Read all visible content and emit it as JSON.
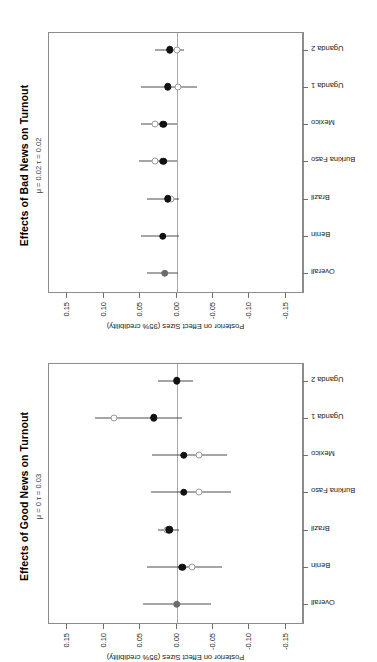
{
  "figure": {
    "orientation": "rotated-90-ccw",
    "panel_count": 2
  },
  "axis": {
    "value_axis_label": "Posterior on Effect Sizes (95% credibility)",
    "value_ticks": [
      "-0.15",
      "-0.10",
      "-0.05",
      "0.00",
      "0.05",
      "0.10",
      "0.15"
    ],
    "value_tick_values": [
      -0.15,
      -0.1,
      -0.05,
      0.0,
      0.05,
      0.1,
      0.15
    ],
    "categories": [
      "Overall",
      "Benin",
      "Brazil",
      "Burkina Faso",
      "Mexico",
      "Uganda 1",
      "Uganda 2"
    ]
  },
  "panels": {
    "bad": {
      "title": "Effects of Bad News on Turnout",
      "subtitle": "μ = 0.02  τ = 0.02"
    },
    "good": {
      "title": "Effects of Good News on Turnout",
      "subtitle": "μ = 0  τ = 0.03"
    }
  },
  "colors": {
    "filled_point": "#111111",
    "open_point": "#9a9a9a",
    "ci_line": "#4d4d4d",
    "zero_line": "#a8a8a8",
    "box_border": "#8c8c8c",
    "background": "#ffffff"
  },
  "chart_data": [
    {
      "type": "scatter",
      "id": "bad-news",
      "title": "Effects of Bad News on Turnout",
      "subtitle": "μ = 0.02  τ = 0.02",
      "xlabel": "",
      "ylabel": "Posterior on Effect Sizes (95% credibility)",
      "ylim": [
        -0.175,
        0.175
      ],
      "grid": false,
      "legend": "none",
      "categories": [
        "Overall",
        "Benin",
        "Brazil",
        "Burkina Faso",
        "Mexico",
        "Uganda 1",
        "Uganda 2"
      ],
      "series": [
        {
          "name": "Posterior (shrunken)",
          "marker": "filled-circle",
          "values": [
            0.016,
            0.019,
            0.012,
            0.018,
            0.018,
            0.012,
            0.009
          ],
          "ci_low": [
            -0.002,
            -0.003,
            -0.003,
            -0.001,
            -0.001,
            -0.028,
            -0.01
          ],
          "ci_high": [
            0.04,
            0.049,
            0.041,
            0.051,
            0.049,
            0.049,
            0.03
          ]
        },
        {
          "name": "Raw estimate",
          "marker": "open-circle",
          "values": [
            null,
            null,
            0.008,
            0.03,
            0.03,
            -0.002,
            0.0
          ]
        }
      ]
    },
    {
      "type": "scatter",
      "id": "good-news",
      "title": "Effects of Good News on Turnout",
      "subtitle": "μ = 0  τ = 0.03",
      "xlabel": "",
      "ylabel": "Posterior on Effect Sizes (95% credibility)",
      "ylim": [
        -0.175,
        0.175
      ],
      "grid": false,
      "legend": "none",
      "categories": [
        "Overall",
        "Benin",
        "Brazil",
        "Burkina Faso",
        "Mexico",
        "Uganda 1",
        "Uganda 2"
      ],
      "series": [
        {
          "name": "Posterior (shrunken)",
          "marker": "filled-circle",
          "values": [
            0.0,
            -0.008,
            0.01,
            -0.01,
            -0.01,
            0.031,
            0.0
          ],
          "ci_low": [
            -0.047,
            -0.062,
            -0.003,
            -0.075,
            -0.07,
            -0.008,
            -0.022
          ],
          "ci_high": [
            0.046,
            0.04,
            0.026,
            0.035,
            0.034,
            0.112,
            0.026
          ]
        },
        {
          "name": "Raw estimate",
          "marker": "open-circle",
          "values": [
            null,
            -0.021,
            0.013,
            -0.031,
            -0.031,
            0.086,
            null
          ]
        }
      ]
    }
  ]
}
